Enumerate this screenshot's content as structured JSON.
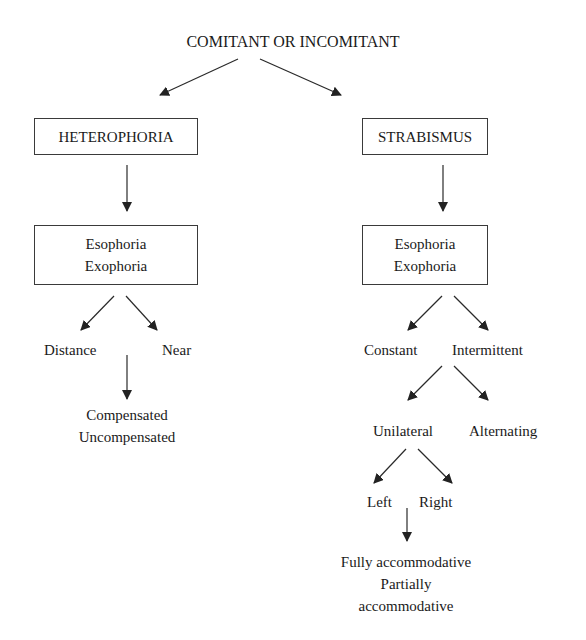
{
  "diagram": {
    "root": "COMITANT OR INCOMITANT",
    "left": {
      "title": "HETEROPHORIA",
      "types": [
        "Esophoria",
        "Exophoria"
      ],
      "branches": [
        "Distance",
        "Near"
      ],
      "sub": [
        "Compensated",
        "Uncompensated"
      ]
    },
    "right": {
      "title": "STRABISMUS",
      "types": [
        "Esophoria",
        "Exophoria"
      ],
      "branches": [
        "Constant",
        "Intermittent"
      ],
      "level2": [
        "Unilateral",
        "Alternating"
      ],
      "level3": [
        "Left",
        "Right"
      ],
      "sub": [
        "Fully accommodative",
        "Partially",
        "accommodative"
      ]
    },
    "colors": {
      "line": "#2a2a2a",
      "text": "#1a1a1a",
      "background": "#ffffff"
    }
  }
}
